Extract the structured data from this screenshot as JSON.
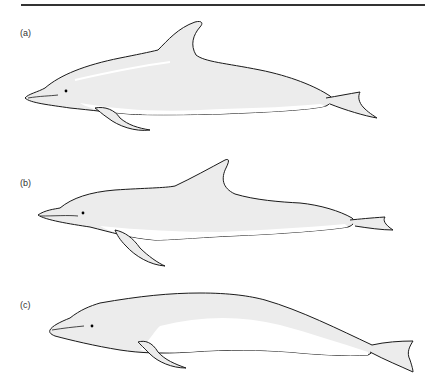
{
  "figure": {
    "panels": [
      {
        "id": "a",
        "label": "(a)"
      },
      {
        "id": "b",
        "label": "(b)"
      },
      {
        "id": "c",
        "label": "(c)"
      }
    ],
    "colors": {
      "outline": "#1a1a1a",
      "body_fill": "#ececec",
      "belly_fill": "#ffffff",
      "rule": "#333333"
    }
  }
}
